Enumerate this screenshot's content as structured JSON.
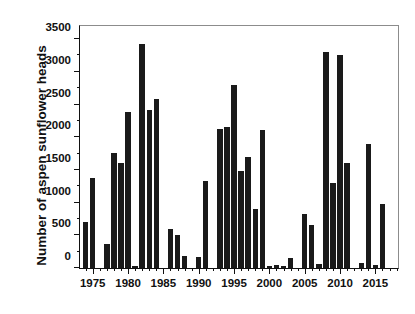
{
  "chart_data": {
    "type": "bar",
    "title": "",
    "subtitle": "",
    "xlabel": "",
    "ylabel": "Number of aspen sunflower heads",
    "xlim": [
      1973.2,
      1918.0
    ],
    "x_range": [
      1973.2,
      2018.2
    ],
    "ylim": [
      0,
      3700
    ],
    "yticks": [
      0,
      500,
      1000,
      1500,
      2000,
      2500,
      3000,
      3500
    ],
    "ytick_labels": [
      "0",
      "500",
      "1000",
      "1500",
      "2000",
      "2500",
      "3000",
      "3500"
    ],
    "y_minor_tick_step": 250,
    "xticks": [
      1975,
      1980,
      1985,
      1990,
      1995,
      2000,
      2005,
      2010,
      2015
    ],
    "xtick_labels": [
      "1975",
      "1980",
      "1985",
      "1990",
      "1995",
      "2000",
      "2005",
      "2010",
      "2015"
    ],
    "x_minor_tick_step": 1,
    "grid": false,
    "legend": null,
    "bar_color": "#1a1a1a",
    "categories": [
      1974,
      1975,
      1977,
      1978,
      1979,
      1980,
      1981,
      1982,
      1983,
      1984,
      1986,
      1987,
      1988,
      1990,
      1991,
      1993,
      1994,
      1995,
      1996,
      1997,
      1998,
      1999,
      2000,
      2001,
      2002,
      2003,
      2005,
      2006,
      2007,
      2008,
      2009,
      2010,
      2011,
      2013,
      2014,
      2015,
      2016,
      2017
    ],
    "values": [
      710,
      1380,
      360,
      1760,
      1600,
      2390,
      30,
      3430,
      2410,
      2590,
      600,
      500,
      190,
      170,
      1330,
      2120,
      2150,
      2800,
      1490,
      1700,
      900,
      2110,
      35,
      40,
      30,
      160,
      830,
      660,
      60,
      3300,
      1300,
      3260,
      1600,
      80,
      1900,
      50,
      980,
      0
    ],
    "data_points": [
      {
        "year": 1974,
        "value": 710
      },
      {
        "year": 1975,
        "value": 1380
      },
      {
        "year": 1977,
        "value": 360
      },
      {
        "year": 1978,
        "value": 1760
      },
      {
        "year": 1979,
        "value": 1600
      },
      {
        "year": 1980,
        "value": 2390
      },
      {
        "year": 1981,
        "value": 30
      },
      {
        "year": 1982,
        "value": 3430
      },
      {
        "year": 1983,
        "value": 2410
      },
      {
        "year": 1984,
        "value": 2590
      },
      {
        "year": 1986,
        "value": 600
      },
      {
        "year": 1987,
        "value": 500
      },
      {
        "year": 1988,
        "value": 190
      },
      {
        "year": 1990,
        "value": 170
      },
      {
        "year": 1991,
        "value": 1330
      },
      {
        "year": 1993,
        "value": 2120
      },
      {
        "year": 1994,
        "value": 2150
      },
      {
        "year": 1995,
        "value": 2800
      },
      {
        "year": 1996,
        "value": 1490
      },
      {
        "year": 1997,
        "value": 1700
      },
      {
        "year": 1998,
        "value": 900
      },
      {
        "year": 1999,
        "value": 2110
      },
      {
        "year": 2000,
        "value": 35
      },
      {
        "year": 2001,
        "value": 40
      },
      {
        "year": 2002,
        "value": 30
      },
      {
        "year": 2003,
        "value": 160
      },
      {
        "year": 2005,
        "value": 830
      },
      {
        "year": 2006,
        "value": 660
      },
      {
        "year": 2007,
        "value": 60
      },
      {
        "year": 2008,
        "value": 3300
      },
      {
        "year": 2009,
        "value": 1300
      },
      {
        "year": 2010,
        "value": 3260
      },
      {
        "year": 2011,
        "value": 1600
      },
      {
        "year": 2013,
        "value": 80
      },
      {
        "year": 2014,
        "value": 1900
      },
      {
        "year": 2015,
        "value": 50
      },
      {
        "year": 2016,
        "value": 980
      }
    ]
  }
}
